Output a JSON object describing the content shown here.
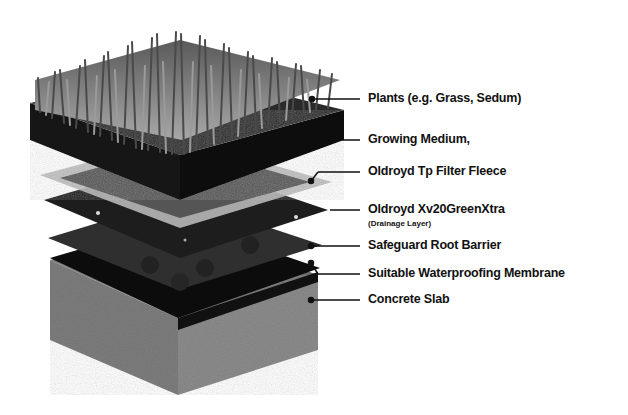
{
  "diagram": {
    "layers": [
      {
        "label": "Plants (e.g. Grass, Sedum)",
        "sublabel": null,
        "y": 99
      },
      {
        "label": "Growing Medium,",
        "sublabel": null,
        "y": 140
      },
      {
        "label": "Oldroyd Tp Filter Fleece",
        "sublabel": null,
        "y": 174
      },
      {
        "label": "Oldroyd Xv20GreenXtra",
        "sublabel": "(Drainage Layer)",
        "y": 211
      },
      {
        "label": "Safeguard Root Barrier",
        "sublabel": null,
        "y": 246
      },
      {
        "label": "Suitable Waterproofing Membrane",
        "sublabel": null,
        "y": 273
      },
      {
        "label": "Concrete Slab",
        "sublabel": null,
        "y": 300
      }
    ],
    "colors": {
      "grass": "#8a8a8a",
      "soil": "#151515",
      "fleece": "#b5b5b5",
      "drainage": "#1c1c1c",
      "root_barrier": "#3a3a3a",
      "membrane": "#0c0c0c",
      "concrete": "#7d7d7d",
      "leader": "#111111"
    }
  }
}
